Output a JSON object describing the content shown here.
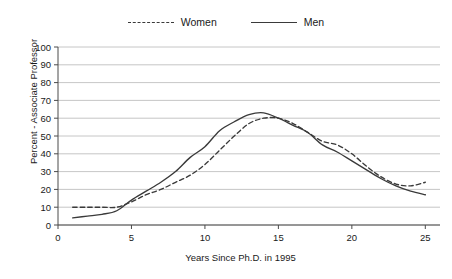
{
  "chart_data": {
    "type": "line",
    "title": "",
    "xlabel": "Years Since Ph.D. in 1995",
    "ylabel": "Percent - Associate Professor",
    "xlim": [
      0,
      26
    ],
    "ylim": [
      0,
      100
    ],
    "xticks": [
      0,
      5,
      10,
      15,
      20,
      25
    ],
    "yticks": [
      0,
      10,
      20,
      30,
      40,
      50,
      60,
      70,
      80,
      90,
      100
    ],
    "grid": true,
    "legend_position": "top-center",
    "x": [
      1,
      2,
      3,
      4,
      5,
      6,
      7,
      8,
      9,
      10,
      11,
      12,
      13,
      14,
      15,
      16,
      17,
      18,
      19,
      20,
      21,
      22,
      23,
      24,
      25
    ],
    "series": [
      {
        "name": "Women",
        "style": "dashed",
        "color": "#3a3a3a",
        "values": [
          10,
          10,
          10,
          10,
          13,
          17,
          20,
          24,
          28,
          34,
          42,
          50,
          57,
          60,
          60,
          57,
          52,
          47,
          45,
          40,
          33,
          27,
          23,
          22,
          24
        ]
      },
      {
        "name": "Men",
        "style": "solid",
        "color": "#3a3a3a",
        "values": [
          4,
          5,
          6,
          8,
          14,
          19,
          24,
          30,
          38,
          44,
          53,
          58,
          62,
          63,
          60,
          56,
          52,
          45,
          41,
          36,
          31,
          26,
          22,
          19,
          17
        ]
      }
    ]
  },
  "legend": {
    "entries": [
      {
        "label": "Women",
        "style": "dashed"
      },
      {
        "label": "Men",
        "style": "solid"
      }
    ]
  },
  "axes": {
    "y_title": "Percent - Associate Professor",
    "x_title": "Years Since Ph.D. in 1995"
  },
  "colors": {
    "line": "#3a3a3a",
    "grid": "#b8b8b8",
    "axis": "#4a4a4a",
    "background": "#ffffff",
    "text": "#1a1a1a"
  }
}
